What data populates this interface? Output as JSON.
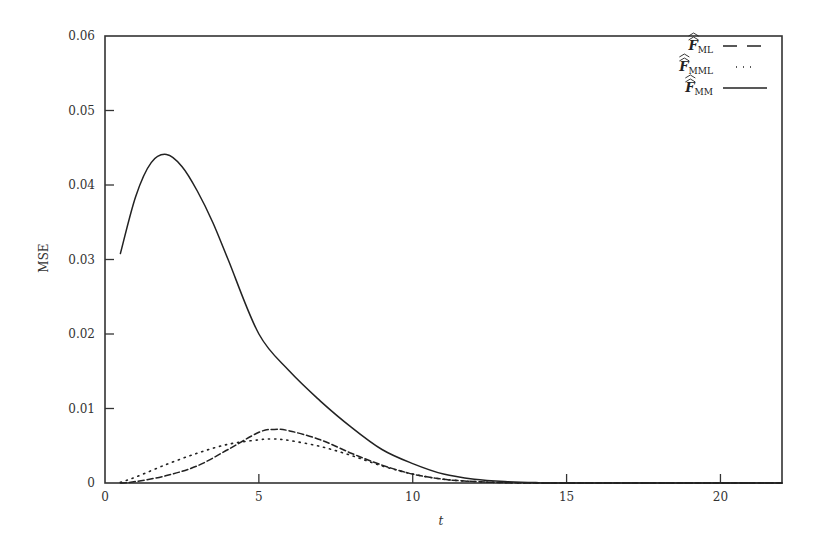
{
  "chart_data": {
    "type": "line",
    "title": "",
    "xlabel": "t",
    "ylabel": "MSE",
    "xlim": [
      0,
      22
    ],
    "ylim": [
      0,
      0.06
    ],
    "xticks": [
      0,
      5,
      10,
      15,
      20
    ],
    "xtick_labels": [
      "0",
      "5",
      "10",
      "15",
      "20"
    ],
    "yticks": [
      0,
      0.01,
      0.02,
      0.03,
      0.04,
      0.05,
      0.06
    ],
    "ytick_labels": [
      "0",
      "0.01",
      "0.02",
      "0.03",
      "0.04",
      "0.05",
      "0.06"
    ],
    "grid": false,
    "legend_position": "upper right",
    "series": [
      {
        "name": "F̂̂ ML",
        "legend_main": "F",
        "legend_sub": "ML",
        "style": "dashed",
        "x": [
          0.5,
          1,
          2,
          3,
          4,
          5,
          5.5,
          6,
          7,
          8,
          9,
          10,
          11,
          12,
          13,
          14,
          15,
          22
        ],
        "values": [
          0.0,
          0.0002,
          0.001,
          0.0023,
          0.0045,
          0.0068,
          0.0072,
          0.007,
          0.0058,
          0.004,
          0.0024,
          0.0012,
          0.0005,
          0.0002,
          5e-05,
          0.0,
          0.0,
          0.0
        ]
      },
      {
        "name": "F̂̂ MML",
        "legend_main": "F",
        "legend_sub": "MML",
        "style": "dotted",
        "x": [
          0.5,
          1,
          2,
          3,
          4,
          5,
          5.5,
          6,
          7,
          8,
          9,
          10,
          11,
          12,
          13,
          14,
          15,
          22
        ],
        "values": [
          0.0001,
          0.0008,
          0.0025,
          0.004,
          0.0052,
          0.0058,
          0.0059,
          0.0057,
          0.0049,
          0.0037,
          0.0023,
          0.0012,
          0.0005,
          0.0002,
          5e-05,
          0.0,
          0.0,
          0.0
        ]
      },
      {
        "name": "F̂̂ MM",
        "legend_main": "F",
        "legend_sub": "MM",
        "style": "solid",
        "x": [
          0.5,
          1,
          1.5,
          2,
          2.5,
          3,
          3.5,
          4,
          5,
          6,
          7,
          8,
          9,
          10,
          11,
          12,
          13,
          14,
          15,
          22
        ],
        "values": [
          0.0308,
          0.0385,
          0.043,
          0.0441,
          0.0425,
          0.0392,
          0.035,
          0.03,
          0.02,
          0.015,
          0.011,
          0.0075,
          0.0045,
          0.0026,
          0.0012,
          0.0005,
          0.0002,
          5e-05,
          0.0,
          0.0
        ]
      }
    ]
  },
  "colors": {
    "line": "#222222",
    "axis": "#333333",
    "background": "#ffffff"
  }
}
